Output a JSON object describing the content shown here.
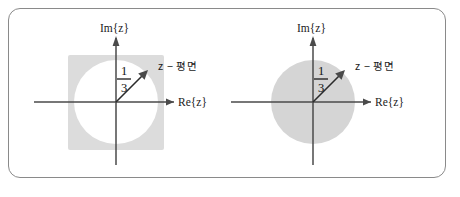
{
  "figure": {
    "name": "z-plane-region-diagrams",
    "background_color": "#ffffff",
    "frame": {
      "border_color": "#8a8a8a",
      "corner_radius": "12px"
    },
    "panels": [
      {
        "id": "left",
        "name": "exterior-region-panel",
        "shading": "outside-circle",
        "shade_color": "#dcdcdc",
        "circle_fill": "#ffffff",
        "imaginary_axis_label": "Im{z}",
        "real_axis_label": "Re{z}",
        "plane_label": "z − 평면",
        "radius_numerator": "1",
        "radius_denominator": "3",
        "radius_value": 0.3333,
        "origin": {
          "x": 110,
          "y": 102
        },
        "circle_radius_px": 42,
        "vector_angle_deg": 45
      },
      {
        "id": "right",
        "name": "interior-region-panel",
        "shading": "inside-circle",
        "shade_color": "#d5d5d5",
        "circle_fill": "#d5d5d5",
        "imaginary_axis_label": "Im{z}",
        "real_axis_label": "Re{z}",
        "plane_label": "z − 평면",
        "radius_numerator": "1",
        "radius_denominator": "3",
        "radius_value": 0.3333,
        "origin": {
          "x": 110,
          "y": 102
        },
        "circle_radius_px": 42,
        "vector_angle_deg": 45
      }
    ]
  }
}
